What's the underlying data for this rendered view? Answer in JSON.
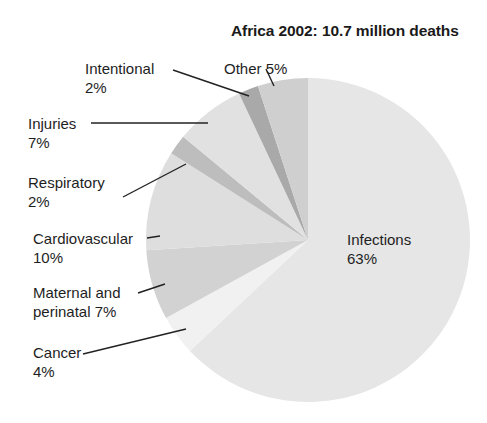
{
  "chart_data": {
    "type": "pie",
    "title": "Africa 2002: 10.7 million deaths",
    "start_angle_deg": 0,
    "direction": "clockwise",
    "center": [
      308,
      240
    ],
    "radius": 162,
    "slices": [
      {
        "name": "Infections",
        "label": "Infections",
        "value_label": "63%",
        "value": 63,
        "color": "#e6e6e6"
      },
      {
        "name": "Cancer",
        "label": "Cancer",
        "value_label": "4%",
        "value": 4,
        "color": "#f1f1f1"
      },
      {
        "name": "Maternal and perinatal",
        "label": "Maternal and",
        "value_label": "perinatal 7%",
        "value": 7,
        "color": "#d2d2d2"
      },
      {
        "name": "Cardiovascular",
        "label": "Cardiovascular",
        "value_label": "10%",
        "value": 10,
        "color": "#dedede"
      },
      {
        "name": "Respiratory",
        "label": "Respiratory",
        "value_label": "2%",
        "value": 2,
        "color": "#bdbdbd"
      },
      {
        "name": "Injuries",
        "label": "Injuries",
        "value_label": "7%",
        "value": 7,
        "color": "#e1e1e1"
      },
      {
        "name": "Intentional",
        "label": "Intentional",
        "value_label": "2%",
        "value": 2,
        "color": "#a9a9a9"
      },
      {
        "name": "Other",
        "label": "Other 5%",
        "value_label": "",
        "value": 5,
        "color": "#cfcfcf"
      }
    ],
    "leader_lines": [
      {
        "slice": "Cancer",
        "from": [
          83,
          354
        ],
        "to": [
          186,
          329
        ]
      },
      {
        "slice": "Maternal and perinatal",
        "from": [
          138,
          293
        ],
        "to": [
          165,
          284
        ]
      },
      {
        "slice": "Cardiovascular",
        "from": [
          147,
          238
        ],
        "to": [
          160,
          236
        ]
      },
      {
        "slice": "Respiratory",
        "from": [
          123,
          197
        ],
        "to": [
          186,
          164
        ]
      },
      {
        "slice": "Injuries",
        "from": [
          91,
          123
        ],
        "to": [
          208,
          123
        ]
      },
      {
        "slice": "Intentional",
        "from": [
          173,
          70
        ],
        "to": [
          249,
          96
        ]
      },
      {
        "slice": "Other",
        "from": [
          266,
          69
        ],
        "to": [
          274,
          86
        ]
      }
    ]
  },
  "title": "Africa 2002: 10.7 million deaths",
  "labels": {
    "infections": {
      "line1": "Infections",
      "line2": "63%"
    },
    "cancer": {
      "line1": "Cancer",
      "line2": "4%"
    },
    "maternal": {
      "line1": "Maternal and",
      "line2": "perinatal 7%"
    },
    "cardiovascular": {
      "line1": "Cardiovascular",
      "line2": "10%"
    },
    "respiratory": {
      "line1": "Respiratory",
      "line2": "2%"
    },
    "injuries": {
      "line1": "Injuries",
      "line2": "7%"
    },
    "intentional": {
      "line1": "Intentional",
      "line2": "2%"
    },
    "other": {
      "line1": "Other 5%"
    }
  }
}
